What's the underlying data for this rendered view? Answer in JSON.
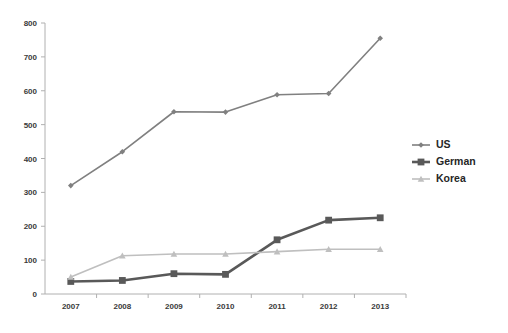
{
  "chart_data": {
    "type": "line",
    "title": "",
    "subtitle": "",
    "xlabel": "",
    "ylabel": "",
    "categories": [
      "2007",
      "2008",
      "2009",
      "2010",
      "2011",
      "2012",
      "2013"
    ],
    "ylim": [
      0,
      800
    ],
    "ytick_values": [
      0,
      100,
      200,
      300,
      400,
      500,
      600,
      700,
      800
    ],
    "ytick_labels": [
      "0",
      "100",
      "200",
      "300",
      "400",
      "500",
      "600",
      "700",
      "800"
    ],
    "grid": false,
    "legend_position": "right",
    "series": [
      {
        "name": "US",
        "values": [
          320,
          420,
          538,
          537,
          588,
          592,
          755
        ],
        "color": "#808080",
        "marker": "diamond"
      },
      {
        "name": "German",
        "values": [
          37,
          40,
          60,
          58,
          160,
          218,
          225
        ],
        "color": "#595959",
        "marker": "square"
      },
      {
        "name": "Korea",
        "values": [
          50,
          113,
          118,
          118,
          125,
          132,
          132
        ],
        "color": "#bfbfbf",
        "marker": "triangle"
      }
    ]
  },
  "axes": {
    "y_axis_name": "value-axis",
    "x_axis_name": "year-axis"
  },
  "legend": {
    "entries": [
      {
        "label": "US"
      },
      {
        "label": "German"
      },
      {
        "label": "Korea"
      }
    ]
  },
  "colors": {
    "series_us": "#808080",
    "series_german": "#595959",
    "series_korea": "#bfbfbf",
    "axis": "#b0b0b0",
    "text": "#3a3a3a",
    "background": "#ffffff"
  }
}
